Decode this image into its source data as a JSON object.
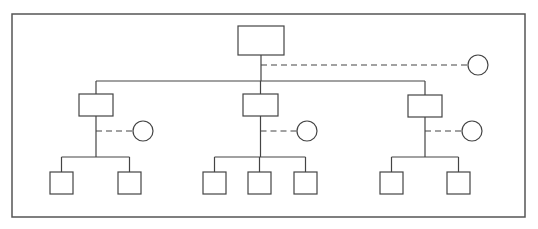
{
  "diagram": {
    "type": "hierarchy-tree",
    "colors": {
      "stroke": "#444444",
      "frame": "#555555",
      "background": "#ffffff"
    },
    "frame": {
      "x": 12,
      "y": 14,
      "width": 513,
      "height": 203
    },
    "root": {
      "id": "root",
      "label": "",
      "box": {
        "x": 238,
        "y": 26,
        "w": 46,
        "h": 29
      },
      "aux_circle": {
        "cx": 478,
        "cy": 65,
        "r": 10,
        "link_y": 65
      }
    },
    "level1_bus_y": 81,
    "level2_bus_y": 157,
    "mid_nodes": [
      {
        "id": "mid-left",
        "label": "",
        "box": {
          "x": 79,
          "y": 94,
          "w": 34,
          "h": 22
        },
        "aux_circle": {
          "cx": 143,
          "cy": 131,
          "r": 10
        },
        "leaves": [
          {
            "id": "leaf-1",
            "label": "",
            "x": 50,
            "y": 172,
            "w": 23,
            "h": 22
          },
          {
            "id": "leaf-2",
            "label": "",
            "x": 118,
            "y": 172,
            "w": 23,
            "h": 22
          }
        ]
      },
      {
        "id": "mid-center",
        "label": "",
        "box": {
          "x": 243,
          "y": 94,
          "w": 35,
          "h": 22
        },
        "aux_circle": {
          "cx": 307,
          "cy": 131,
          "r": 10
        },
        "leaves": [
          {
            "id": "leaf-3",
            "label": "",
            "x": 203,
            "y": 172,
            "w": 23,
            "h": 22
          },
          {
            "id": "leaf-4",
            "label": "",
            "x": 248,
            "y": 172,
            "w": 23,
            "h": 22
          },
          {
            "id": "leaf-5",
            "label": "",
            "x": 294,
            "y": 172,
            "w": 23,
            "h": 22
          }
        ]
      },
      {
        "id": "mid-right",
        "label": "",
        "box": {
          "x": 408,
          "y": 95,
          "w": 34,
          "h": 22
        },
        "aux_circle": {
          "cx": 472,
          "cy": 131,
          "r": 10
        },
        "leaves": [
          {
            "id": "leaf-6",
            "label": "",
            "x": 380,
            "y": 172,
            "w": 23,
            "h": 22
          },
          {
            "id": "leaf-7",
            "label": "",
            "x": 447,
            "y": 172,
            "w": 23,
            "h": 22
          }
        ]
      }
    ]
  }
}
